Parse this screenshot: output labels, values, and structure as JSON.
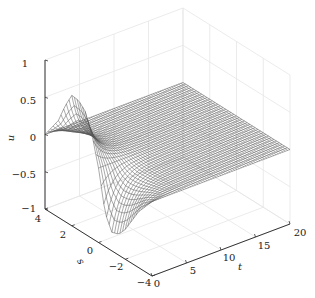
{
  "chart_data": {
    "type": "surface",
    "render": "mesh wireframe (3D)",
    "title": "",
    "xlabel": "t",
    "ylabel": "s",
    "zlabel": "u",
    "xlim": [
      0,
      20
    ],
    "ylim": [
      -4,
      4
    ],
    "zlim": [
      -1,
      1
    ],
    "x_ticks": [
      0,
      5,
      10,
      15,
      20
    ],
    "y_ticks": [
      -4,
      -2,
      0,
      2,
      4
    ],
    "z_ticks": [
      -1,
      -0.5,
      0,
      0.5,
      1
    ],
    "x_tick_labels": [
      "0",
      "5",
      "10",
      "15",
      "20"
    ],
    "y_tick_labels": [
      "−4",
      "−2",
      "0",
      "2",
      "4"
    ],
    "z_tick_labels": [
      "−1",
      "−0.5",
      "0",
      "0.5",
      "1"
    ],
    "grid": true,
    "profile_at_t0": {
      "s": [
        -4,
        -3,
        -2,
        -1.5,
        -1,
        -0.5,
        0,
        0.5,
        1,
        1.5,
        2,
        2.5,
        3,
        4
      ],
      "u": [
        0,
        -0.25,
        -0.6,
        -0.72,
        -0.75,
        -0.55,
        0,
        0.4,
        0.65,
        0.74,
        0.75,
        0.55,
        0.3,
        0
      ]
    },
    "decay_scale_t": 1.5
  },
  "axes": {
    "z": {
      "label": "u",
      "ticks": [
        "1",
        "0.5",
        "0",
        "−0.5",
        "−1"
      ]
    },
    "s": {
      "label": "s",
      "ticks": [
        "4",
        "2",
        "0",
        "−2",
        "−4"
      ]
    },
    "t": {
      "label": "t",
      "ticks": [
        "0",
        "5",
        "10",
        "15",
        "20"
      ]
    }
  },
  "colors": {
    "mesh": "#555555",
    "axis": "#333333",
    "grid": "#e6e6e6",
    "background": "#ffffff"
  }
}
